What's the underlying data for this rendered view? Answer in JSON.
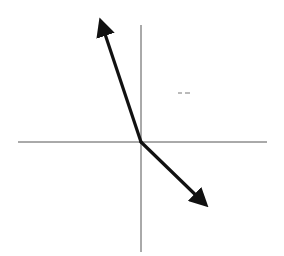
{
  "diagram": {
    "type": "vector-diagram",
    "colors": {
      "background": "#ffffff",
      "axis": "#555555",
      "vector": "#111111",
      "mark": "#777777"
    },
    "origin": {
      "x": 141,
      "y": 142
    },
    "axes": {
      "horizontal": {
        "x1": 18,
        "y1": 142,
        "x2": 267,
        "y2": 142
      },
      "vertical": {
        "x1": 141,
        "y1": 25,
        "x2": 141,
        "y2": 252
      }
    },
    "vectors": [
      {
        "name": "vector-up-left",
        "x1": 141,
        "y1": 142,
        "x2": 101,
        "y2": 22
      },
      {
        "name": "vector-down-right",
        "x1": 141,
        "y1": 142,
        "x2": 205,
        "y2": 204
      }
    ],
    "marks": [
      {
        "name": "dash-mark",
        "x1": 178,
        "y1": 93,
        "x2": 182,
        "y2": 93
      },
      {
        "name": "dash-mark",
        "x1": 185,
        "y1": 93,
        "x2": 190,
        "y2": 93
      }
    ]
  }
}
